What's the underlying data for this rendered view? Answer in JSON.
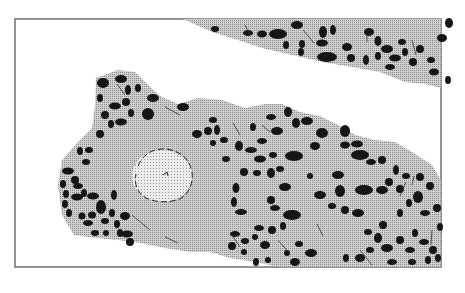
{
  "figure": {
    "type": "histology-illustration",
    "colors": {
      "background": "#ffffff",
      "frame": "#707070",
      "tissue": "#bdbdbd",
      "inclusion": "#e4e4e4",
      "nuclei": "#151515"
    },
    "regions": [
      {
        "name": "upper-tissue-band",
        "label": ""
      },
      {
        "name": "lower-tissue-mass",
        "label": ""
      },
      {
        "name": "pale-inclusion",
        "label": ""
      }
    ]
  }
}
